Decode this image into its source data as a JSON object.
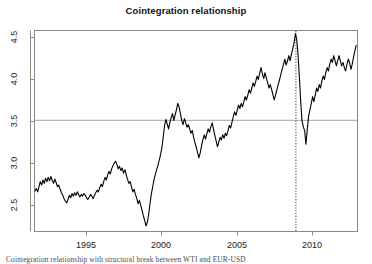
{
  "figure": {
    "title": "Cointegration relationship",
    "caption": "Cointegration relationship with structural break between WTI and EUR-USD",
    "background_color": "#ffffff",
    "frame_color": "#808080",
    "series_color": "#000000",
    "hline_color": "#b5b5b5",
    "vline_color": "#333333"
  },
  "axes": {
    "x_ticks": [
      "1995",
      "2000",
      "2005",
      "2010"
    ],
    "y_ticks": [
      "2.5",
      "3.0",
      "3.5",
      "4.0",
      "4.5"
    ]
  },
  "chart_data": {
    "type": "line",
    "title": "Cointegration relationship",
    "xlabel": "",
    "ylabel": "",
    "xlim": [
      1992.0,
      2012.3
    ],
    "ylim": [
      2.2,
      4.55
    ],
    "xtick_values": [
      1995,
      2000,
      2005,
      2010
    ],
    "xtick_labels": [
      "1995",
      "2000",
      "2005",
      "2010"
    ],
    "ytick_values": [
      2.5,
      3.0,
      3.5,
      4.0,
      4.5
    ],
    "ytick_labels": [
      "2.5",
      "3.0",
      "3.5",
      "4.0",
      "4.5"
    ],
    "grid": false,
    "legend": null,
    "annotations": [
      {
        "kind": "hline",
        "y": 3.5,
        "label": "long-run mean",
        "color": "#b5b5b5"
      },
      {
        "kind": "vline",
        "x": 2008.45,
        "label": "structural break",
        "style": "dotted",
        "color": "#333333"
      }
    ],
    "series": [
      {
        "name": "cointegration residual",
        "color": "#000000",
        "x": [
          1992.0,
          1992.08,
          1992.17,
          1992.25,
          1992.33,
          1992.42,
          1992.5,
          1992.58,
          1992.67,
          1992.75,
          1992.83,
          1992.92,
          1993.0,
          1993.08,
          1993.17,
          1993.25,
          1993.33,
          1993.42,
          1993.5,
          1993.58,
          1993.67,
          1993.75,
          1993.83,
          1993.92,
          1994.0,
          1994.08,
          1994.17,
          1994.25,
          1994.33,
          1994.42,
          1994.5,
          1994.58,
          1994.67,
          1994.75,
          1994.83,
          1994.92,
          1995.0,
          1995.08,
          1995.17,
          1995.25,
          1995.33,
          1995.42,
          1995.5,
          1995.58,
          1995.67,
          1995.75,
          1995.83,
          1995.92,
          1996.0,
          1996.08,
          1996.17,
          1996.25,
          1996.33,
          1996.42,
          1996.5,
          1996.58,
          1996.67,
          1996.75,
          1996.83,
          1996.92,
          1997.0,
          1997.08,
          1997.17,
          1997.25,
          1997.33,
          1997.42,
          1997.5,
          1997.58,
          1997.67,
          1997.75,
          1997.83,
          1997.92,
          1998.0,
          1998.08,
          1998.17,
          1998.25,
          1998.33,
          1998.42,
          1998.5,
          1998.58,
          1998.67,
          1998.75,
          1998.83,
          1998.92,
          1999.0,
          1999.08,
          1999.17,
          1999.25,
          1999.33,
          1999.42,
          1999.5,
          1999.58,
          1999.67,
          1999.75,
          1999.83,
          1999.92,
          2000.0,
          2000.08,
          2000.17,
          2000.25,
          2000.33,
          2000.42,
          2000.5,
          2000.58,
          2000.67,
          2000.75,
          2000.83,
          2000.92,
          2001.0,
          2001.08,
          2001.17,
          2001.25,
          2001.33,
          2001.42,
          2001.5,
          2001.58,
          2001.67,
          2001.75,
          2001.83,
          2001.92,
          2002.0,
          2002.08,
          2002.17,
          2002.25,
          2002.33,
          2002.42,
          2002.5,
          2002.58,
          2002.67,
          2002.75,
          2002.83,
          2002.92,
          2003.0,
          2003.08,
          2003.17,
          2003.25,
          2003.33,
          2003.42,
          2003.5,
          2003.58,
          2003.67,
          2003.75,
          2003.83,
          2003.92,
          2004.0,
          2004.08,
          2004.17,
          2004.25,
          2004.33,
          2004.42,
          2004.5,
          2004.58,
          2004.67,
          2004.75,
          2004.83,
          2004.92,
          2005.0,
          2005.08,
          2005.17,
          2005.25,
          2005.33,
          2005.42,
          2005.5,
          2005.58,
          2005.67,
          2005.75,
          2005.83,
          2005.92,
          2006.0,
          2006.08,
          2006.17,
          2006.25,
          2006.33,
          2006.42,
          2006.5,
          2006.58,
          2006.67,
          2006.75,
          2006.83,
          2006.92,
          2007.0,
          2007.08,
          2007.17,
          2007.25,
          2007.33,
          2007.42,
          2007.5,
          2007.58,
          2007.67,
          2007.75,
          2007.83,
          2007.92,
          2008.0,
          2008.08,
          2008.17,
          2008.25,
          2008.33,
          2008.42,
          2008.5,
          2008.58,
          2008.67,
          2008.75,
          2008.83,
          2008.92,
          2009.0,
          2009.08,
          2009.17,
          2009.25,
          2009.33,
          2009.42,
          2009.5,
          2009.58,
          2009.67,
          2009.75,
          2009.83,
          2009.92,
          2010.0,
          2010.08,
          2010.17,
          2010.25,
          2010.33,
          2010.42,
          2010.5,
          2010.58,
          2010.67,
          2010.75,
          2010.83,
          2010.92,
          2011.0,
          2011.08,
          2011.17,
          2011.25,
          2011.33,
          2011.42,
          2011.5,
          2011.58,
          2011.67,
          2011.75,
          2011.83,
          2011.92,
          2012.0,
          2012.08,
          2012.17,
          2012.25
        ],
        "y": [
          2.67,
          2.7,
          2.66,
          2.72,
          2.78,
          2.74,
          2.8,
          2.76,
          2.82,
          2.78,
          2.83,
          2.79,
          2.84,
          2.8,
          2.76,
          2.81,
          2.77,
          2.72,
          2.74,
          2.69,
          2.65,
          2.62,
          2.58,
          2.55,
          2.53,
          2.57,
          2.62,
          2.59,
          2.64,
          2.61,
          2.65,
          2.62,
          2.66,
          2.63,
          2.6,
          2.63,
          2.61,
          2.64,
          2.62,
          2.59,
          2.57,
          2.6,
          2.63,
          2.61,
          2.58,
          2.62,
          2.65,
          2.68,
          2.66,
          2.71,
          2.75,
          2.72,
          2.78,
          2.83,
          2.8,
          2.86,
          2.9,
          2.87,
          2.93,
          2.97,
          3.0,
          3.02,
          2.98,
          2.93,
          2.96,
          2.91,
          2.94,
          2.88,
          2.92,
          2.86,
          2.81,
          2.76,
          2.78,
          2.72,
          2.66,
          2.69,
          2.63,
          2.58,
          2.52,
          2.56,
          2.5,
          2.44,
          2.38,
          2.32,
          2.26,
          2.3,
          2.4,
          2.52,
          2.63,
          2.72,
          2.8,
          2.86,
          2.92,
          2.97,
          3.03,
          3.1,
          3.18,
          3.3,
          3.44,
          3.51,
          3.46,
          3.4,
          3.47,
          3.53,
          3.58,
          3.5,
          3.56,
          3.63,
          3.7,
          3.66,
          3.58,
          3.5,
          3.45,
          3.52,
          3.47,
          3.42,
          3.45,
          3.4,
          3.35,
          3.38,
          3.3,
          3.24,
          3.18,
          3.12,
          3.06,
          3.12,
          3.2,
          3.27,
          3.33,
          3.28,
          3.34,
          3.4,
          3.36,
          3.42,
          3.47,
          3.4,
          3.33,
          3.26,
          3.19,
          3.24,
          3.3,
          3.27,
          3.33,
          3.29,
          3.35,
          3.32,
          3.38,
          3.44,
          3.41,
          3.48,
          3.54,
          3.6,
          3.56,
          3.62,
          3.68,
          3.64,
          3.7,
          3.66,
          3.72,
          3.78,
          3.74,
          3.8,
          3.86,
          3.82,
          3.88,
          3.94,
          3.9,
          3.96,
          4.02,
          3.98,
          4.06,
          4.12,
          4.05,
          3.99,
          4.06,
          4.0,
          3.94,
          3.88,
          3.92,
          3.86,
          3.8,
          3.74,
          3.8,
          3.86,
          3.92,
          3.98,
          4.04,
          4.1,
          4.16,
          4.22,
          4.15,
          4.2,
          4.26,
          4.2,
          4.28,
          4.34,
          4.41,
          4.52,
          4.45,
          4.28,
          4.0,
          3.72,
          3.5,
          3.42,
          3.38,
          3.22,
          3.4,
          3.55,
          3.62,
          3.7,
          3.78,
          3.72,
          3.8,
          3.88,
          3.84,
          3.92,
          3.88,
          3.96,
          4.02,
          3.98,
          4.06,
          4.12,
          4.08,
          4.16,
          4.22,
          4.18,
          4.26,
          4.2,
          4.14,
          4.2,
          4.26,
          4.2,
          4.14,
          4.18,
          4.12,
          4.08,
          4.16,
          4.22,
          4.18,
          4.1,
          4.16,
          4.24,
          4.32,
          4.38
        ]
      }
    ]
  }
}
